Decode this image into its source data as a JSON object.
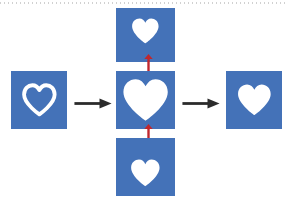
{
  "figure": {
    "title": "Heart shape morphological transformation sequence",
    "background_color": "#ffffff",
    "width": 287,
    "height": 203,
    "top_rule": {
      "style": "dotted",
      "color": "#c9c9c9",
      "label": "dotted scan rule"
    }
  },
  "colors": {
    "tile_blue": "#4472b8",
    "heart_white": "#ffffff",
    "arrow_black": "#2b2b2b",
    "arrow_red": "#c1272d",
    "page_white": "#ffffff"
  },
  "panels": [
    {
      "id": "input-panel",
      "name": "input-heart-outline",
      "label": "Input heart outline",
      "heart_style": "outline",
      "heart_size": "medium",
      "x": 11,
      "y": 71,
      "width": 56,
      "height": 58
    },
    {
      "id": "top-panel",
      "name": "top-heart-small",
      "label": "Small heart, upper position",
      "heart_style": "filled",
      "heart_size": "small",
      "x": 116,
      "y": 8,
      "width": 59,
      "height": 54
    },
    {
      "id": "center-panel",
      "name": "center-heart-large",
      "label": "Large filled heart",
      "heart_style": "filled",
      "heart_size": "large",
      "x": 116,
      "y": 71,
      "width": 59,
      "height": 58
    },
    {
      "id": "bottom-panel",
      "name": "bottom-heart-small",
      "label": "Small heart, lower position",
      "heart_style": "filled",
      "heart_size": "small",
      "x": 116,
      "y": 138,
      "width": 59,
      "height": 58
    },
    {
      "id": "output-panel",
      "name": "output-heart-filled",
      "label": "Output filled heart",
      "heart_style": "filled",
      "heart_size": "medium",
      "x": 226,
      "y": 71,
      "width": 56,
      "height": 58
    }
  ],
  "arrows": [
    {
      "id": "arrow-input-to-center",
      "label": "Input to center",
      "direction": "right",
      "heads": "single",
      "color": "#2b2b2b",
      "x": 74,
      "y": 97,
      "length": 38
    },
    {
      "id": "arrow-center-to-output",
      "label": "Center to output",
      "direction": "right",
      "heads": "single",
      "color": "#2b2b2b",
      "x": 182,
      "y": 97,
      "length": 38
    },
    {
      "id": "arrow-top-center-link",
      "label": "Top and center bidirectional link",
      "direction": "vertical",
      "heads": "double",
      "color": "#c1272d",
      "x": 142,
      "y": 54,
      "length": 22
    },
    {
      "id": "arrow-center-bottom-link",
      "label": "Center and bottom bidirectional link",
      "direction": "vertical",
      "heads": "double",
      "color": "#c1272d",
      "x": 142,
      "y": 124,
      "length": 22
    }
  ]
}
